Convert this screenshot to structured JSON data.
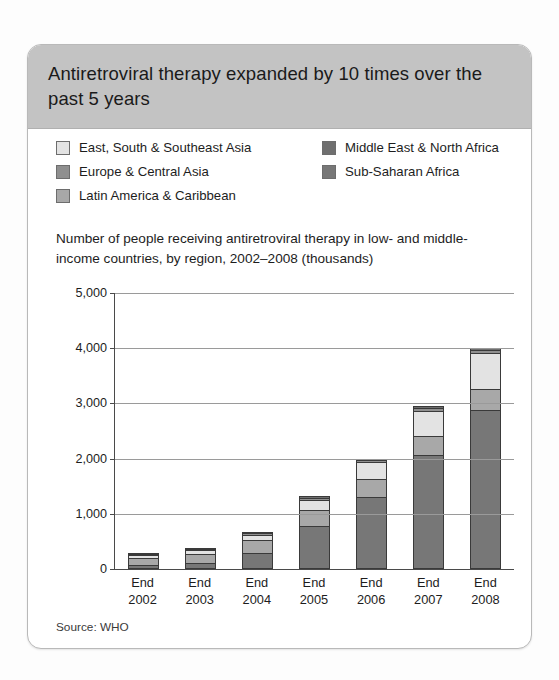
{
  "card": {
    "title": "Antiretroviral therapy expanded by 10 times over the past 5 years",
    "subtitle": "Number of people receiving antiretroviral therapy in low- and middle-income countries, by region, 2002–2008 (thousands)",
    "source": "Source: WHO"
  },
  "colors": {
    "header_band": "#c3c3c3",
    "card_border": "#b9b9b9",
    "axis": "#4a4a4a",
    "gridline": "#9a9a9a",
    "east_south_southeast_asia": "#e3e3e3",
    "europe_central_asia": "#8f8f8f",
    "latin_america_caribbean": "#a8a8a8",
    "middle_east_north_africa": "#6f6f6f",
    "sub_saharan_africa": "#777777"
  },
  "chart_data": {
    "type": "bar",
    "title": "Antiretroviral therapy expanded by 10 times over the past 5 years",
    "subtitle": "Number of people receiving antiretroviral therapy in low- and middle-income countries, by region, 2002–2008 (thousands)",
    "stacked": true,
    "xlabel": "",
    "ylabel": "",
    "ylim": [
      0,
      5000
    ],
    "yticks": [
      "0",
      "1,000",
      "2,000",
      "3,000",
      "4,000",
      "5,000"
    ],
    "ytick_values": [
      0,
      1000,
      2000,
      3000,
      4000,
      5000
    ],
    "grid": true,
    "legend_position": "top",
    "categories": [
      "End 2002",
      "End 2003",
      "End 2004",
      "End 2005",
      "End 2006",
      "End 2007",
      "End 2008"
    ],
    "category_lines": [
      [
        "End",
        "2002"
      ],
      [
        "End",
        "2003"
      ],
      [
        "End",
        "2004"
      ],
      [
        "End",
        "2005"
      ],
      [
        "End",
        "2006"
      ],
      [
        "End",
        "2007"
      ],
      [
        "End",
        "2008"
      ]
    ],
    "series": [
      {
        "name": "Sub-Saharan Africa",
        "color": "#777777",
        "values": [
          50,
          100,
          310,
          810,
          1340,
          2100,
          2925
        ]
      },
      {
        "name": "Latin America & Caribbean",
        "color": "#a8a8a8",
        "values": [
          190,
          210,
          255,
          290,
          325,
          350,
          380
        ]
      },
      {
        "name": "East, South & Southeast Asia",
        "color": "#e3e3e3",
        "values": [
          40,
          60,
          90,
          190,
          300,
          450,
          640
        ]
      },
      {
        "name": "Europe & Central Asia",
        "color": "#8f8f8f",
        "values": [
          5,
          10,
          15,
          20,
          25,
          40,
          45
        ]
      },
      {
        "name": "Middle East & North Africa",
        "color": "#6f6f6f",
        "values": [
          5,
          5,
          5,
          10,
          10,
          10,
          10
        ]
      }
    ],
    "totals": [
      290,
      385,
      675,
      1320,
      2000,
      2950,
      4000
    ],
    "annotations": [
      "Source: WHO"
    ]
  },
  "legend": {
    "left_column": [
      {
        "label": "East, South & Southeast Asia",
        "color": "#e3e3e3"
      },
      {
        "label": "Europe & Central Asia",
        "color": "#8f8f8f"
      },
      {
        "label": "Latin America & Caribbean",
        "color": "#a8a8a8"
      }
    ],
    "right_column": [
      {
        "label": "Middle East & North Africa",
        "color": "#6f6f6f"
      },
      {
        "label": "Sub-Saharan Africa",
        "color": "#777777"
      }
    ]
  }
}
